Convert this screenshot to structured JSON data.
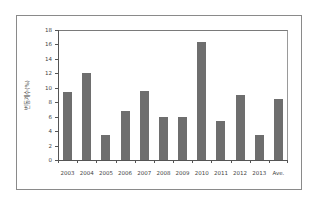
{
  "chart_data": {
    "type": "bar",
    "title": "",
    "xlabel": "",
    "ylabel": "변동계수(%)",
    "categories": [
      "2003",
      "2004",
      "2005",
      "2006",
      "2007",
      "2008",
      "2009",
      "2010",
      "2011",
      "2012",
      "2013",
      "Ave."
    ],
    "values": [
      9.4,
      12.0,
      3.5,
      6.8,
      9.5,
      6.0,
      6.0,
      16.3,
      5.4,
      9.0,
      3.5,
      8.4
    ],
    "ylim": [
      0,
      18
    ],
    "yticks": [
      "0",
      "2",
      "4",
      "6",
      "8",
      "10",
      "12",
      "14",
      "16",
      "18"
    ],
    "grid": false,
    "legend": null,
    "bar_color": "#6e6e6e"
  }
}
